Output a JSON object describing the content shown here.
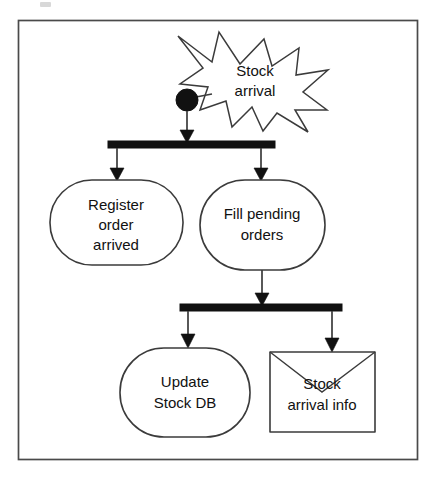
{
  "diagram": {
    "type": "uml-activity-diagram",
    "colors": {
      "line": "#3b3b3b",
      "fill": "#ffffff",
      "solid": "#111111",
      "frame": "#4a4a4a",
      "background": "#ffffff"
    },
    "frame": {
      "label": "diagram-frame"
    },
    "nodes": {
      "signal_event": {
        "label_line1": "Stock",
        "label_line2": "arrival",
        "shape": "starburst"
      },
      "initial_node": {
        "label": "",
        "shape": "filled-circle"
      },
      "fork_bar_top": {
        "label": "",
        "shape": "synchronization-bar"
      },
      "activity_register": {
        "label_line1": "Register",
        "label_line2": "order",
        "label_line3": "arrived",
        "shape": "rounded-rectangle"
      },
      "activity_fill": {
        "label_line1": "Fill pending",
        "label_line2": "orders",
        "shape": "rounded-rectangle"
      },
      "fork_bar_bottom": {
        "label": "",
        "shape": "synchronization-bar"
      },
      "activity_update": {
        "label_line1": "Update",
        "label_line2": "Stock DB",
        "shape": "rounded-rectangle"
      },
      "object_stock_info": {
        "label_line1": "Stock",
        "label_line2": "arrival info",
        "shape": "envelope"
      }
    },
    "edges": [
      {
        "from": "initial_node",
        "to": "fork_bar_top"
      },
      {
        "from": "fork_bar_top",
        "to": "activity_register"
      },
      {
        "from": "fork_bar_top",
        "to": "activity_fill"
      },
      {
        "from": "activity_fill",
        "to": "fork_bar_bottom"
      },
      {
        "from": "fork_bar_bottom",
        "to": "activity_update"
      },
      {
        "from": "fork_bar_bottom",
        "to": "object_stock_info"
      }
    ]
  }
}
